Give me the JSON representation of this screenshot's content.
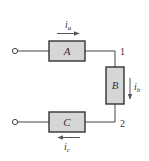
{
  "diagram": {
    "type": "circuit",
    "colors": {
      "wire": "#444444",
      "box_fill": "#d6d6d6",
      "box_stroke": "#333333",
      "arrow": "#555555",
      "text": "#333333"
    },
    "elements": [
      {
        "id": "A",
        "label": "A"
      },
      {
        "id": "B",
        "label": "B"
      },
      {
        "id": "C",
        "label": "C"
      }
    ],
    "nodes": [
      {
        "id": "1",
        "label": "1"
      },
      {
        "id": "2",
        "label": "2"
      }
    ],
    "currents": [
      {
        "id": "ia",
        "base": "i",
        "sub": "a",
        "direction": "right"
      },
      {
        "id": "ib",
        "base": "i",
        "sub": "b",
        "direction": "down"
      },
      {
        "id": "ic",
        "base": "i",
        "sub": "c",
        "direction": "left"
      }
    ]
  }
}
